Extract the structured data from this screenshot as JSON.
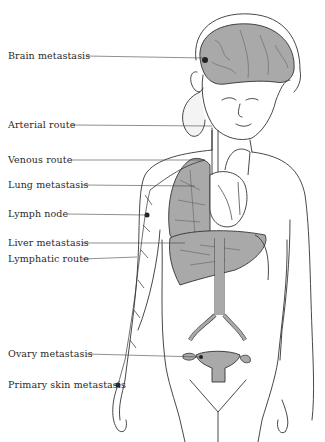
{
  "figure": {
    "labels": [
      {
        "id": "brain",
        "text": "Brain metastasis",
        "x": 8,
        "y": 50,
        "line_to": [
          225,
          58
        ]
      },
      {
        "id": "arterial",
        "text": "Arterial route",
        "x": 8,
        "y": 119,
        "line_to": [
          205,
          126
        ]
      },
      {
        "id": "venous",
        "text": "Venous route",
        "x": 8,
        "y": 155,
        "line_to": [
          215,
          160
        ]
      },
      {
        "id": "lung",
        "text": "Lung metastasis",
        "x": 8,
        "y": 179,
        "line_to": [
          205,
          186
        ]
      },
      {
        "id": "lymph_node",
        "text": "Lymph node",
        "x": 8,
        "y": 208,
        "line_to": [
          147,
          215
        ]
      },
      {
        "id": "liver",
        "text": "Liver metastasis",
        "x": 8,
        "y": 237,
        "line_to": [
          185,
          243
        ]
      },
      {
        "id": "lymphatic",
        "text": "Lymphatic route",
        "x": 8,
        "y": 253,
        "line_to": [
          137,
          257
        ]
      },
      {
        "id": "ovary",
        "text": "Ovary metastasis",
        "x": 8,
        "y": 348,
        "line_to": [
          200,
          357
        ]
      },
      {
        "id": "primary_skin",
        "text": "Primary skin metastasis",
        "x": 8,
        "y": 378,
        "line_to": [
          118,
          385
        ]
      }
    ],
    "colors": {
      "organ_fill": "#a9a9a9",
      "line": "#333333",
      "background": "#ffffff",
      "text": "#2a2a2a"
    }
  }
}
